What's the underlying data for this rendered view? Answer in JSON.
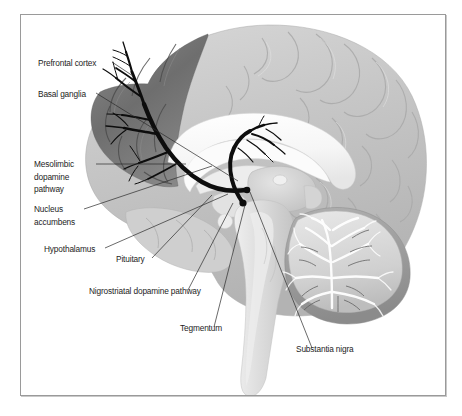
{
  "figure": {
    "frame_color": "#9a9a9a",
    "background": "#ffffff"
  },
  "palette": {
    "cortex_light": "#c9c9c9",
    "cortex_shaded": "#6e6e6e",
    "white_matter": "#f2f2f2",
    "corpus_callosum": "#fbfbfb",
    "cerebellum_body": "#d2d2d2",
    "cerebellum_cortex": "#9b9b9b",
    "brainstem": "#dcdcdc",
    "pathway_black": "#0d0d0d",
    "leader_line": "#2a2a2a",
    "text": "#1d1d1d"
  },
  "labels": [
    {
      "id": "prefrontal-cortex",
      "text": "Prefrontal cortex",
      "lines": [
        "Prefrontal cortex"
      ],
      "text_x": 38,
      "text_y": 66,
      "anchor": "start",
      "leader": "M 112 62 L 133 76"
    },
    {
      "id": "basal-ganglia",
      "text": "Basal ganglia",
      "lines": [
        "Basal ganglia"
      ],
      "text_x": 38,
      "text_y": 97,
      "anchor": "start",
      "leader": "M 96 93 L 238 181"
    },
    {
      "id": "mesolimbic-dopamine-pathway",
      "text": "Mesolimbic dopamine pathway",
      "lines": [
        "Mesolimbic",
        "dopamine",
        "pathway"
      ],
      "text_x": 34,
      "text_y": 167,
      "anchor": "start",
      "leader": "M 96 164 L 186 164"
    },
    {
      "id": "nucleus-accumbens",
      "text": "Nucleus accumbens",
      "lines": [
        "Nucleus",
        "accumbens"
      ],
      "text_x": 34,
      "text_y": 212,
      "anchor": "start",
      "leader": "M 84 209 L 212 166"
    },
    {
      "id": "hypothalamus",
      "text": "Hypothalamus",
      "lines": [
        "Hypothalamus"
      ],
      "text_x": 44,
      "text_y": 252,
      "anchor": "start",
      "leader": "M 105 248 L 228 194"
    },
    {
      "id": "pituitary",
      "text": "Pituitary",
      "lines": [
        "Pituitary"
      ],
      "text_x": 116,
      "text_y": 262,
      "anchor": "start",
      "leader": "M 152 258 L 212 195"
    },
    {
      "id": "nigrostriatal-dopamine-pathway",
      "text": "Nigrostriatal dopamine pathway",
      "lines": [
        "Nigrostriatal dopamine pathway"
      ],
      "text_x": 89,
      "text_y": 294,
      "anchor": "start",
      "leader": "M 188 290 L 233 203"
    },
    {
      "id": "tegmentum",
      "text": "Tegmentum",
      "lines": [
        "Tegmentum"
      ],
      "text_x": 180,
      "text_y": 331,
      "anchor": "start",
      "leader": "M 214 327 L 245 205"
    },
    {
      "id": "substantia-nigra",
      "text": "Substantia nigra",
      "lines": [
        "Substantia nigra"
      ],
      "text_x": 296,
      "text_y": 352,
      "anchor": "start",
      "leader": "M 312 348 L 250 192"
    }
  ],
  "structures": [
    {
      "id": "cerebral-cortex",
      "name": "Cerebral cortex"
    },
    {
      "id": "prefrontal-cortex-region",
      "name": "Prefrontal cortex (shaded)"
    },
    {
      "id": "corpus-callosum",
      "name": "Corpus callosum"
    },
    {
      "id": "thalamus",
      "name": "Thalamus"
    },
    {
      "id": "cerebellum",
      "name": "Cerebellum"
    },
    {
      "id": "brainstem",
      "name": "Brainstem"
    },
    {
      "id": "temporal-lobe",
      "name": "Temporal lobe"
    }
  ],
  "pathway_origins": [
    {
      "id": "vta-origin-dot",
      "cx": 247,
      "cy": 190,
      "r": 3.3
    },
    {
      "id": "substantia-nigra-origin-dot",
      "cx": 243,
      "cy": 203,
      "r": 3.6
    }
  ]
}
